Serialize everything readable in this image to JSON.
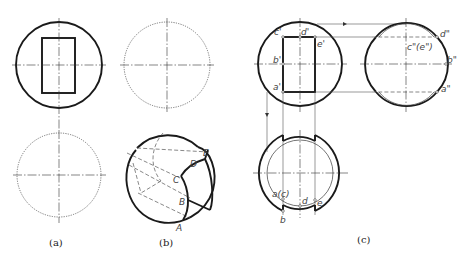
{
  "figure": {
    "captions": {
      "a": "(a)",
      "b": "(b)",
      "c": "(c)"
    },
    "panel_b_points": {
      "A": "A",
      "B": "B",
      "C": "C",
      "D": "D",
      "E": "E"
    },
    "panel_c_front_view_labels": {
      "a": "a'",
      "b": "b'",
      "c": "c'",
      "d": "d'",
      "e": "e'"
    },
    "panel_c_side_view_labels": {
      "a": "a\"",
      "b": "b\"",
      "ce": "c\"(e\")",
      "d": "d\""
    },
    "panel_c_top_view_labels": {
      "ac": "a(c)",
      "b": "b",
      "d": "d",
      "e": "e"
    },
    "colors": {
      "line": "#1a1a1a",
      "background": "#ffffff"
    }
  }
}
